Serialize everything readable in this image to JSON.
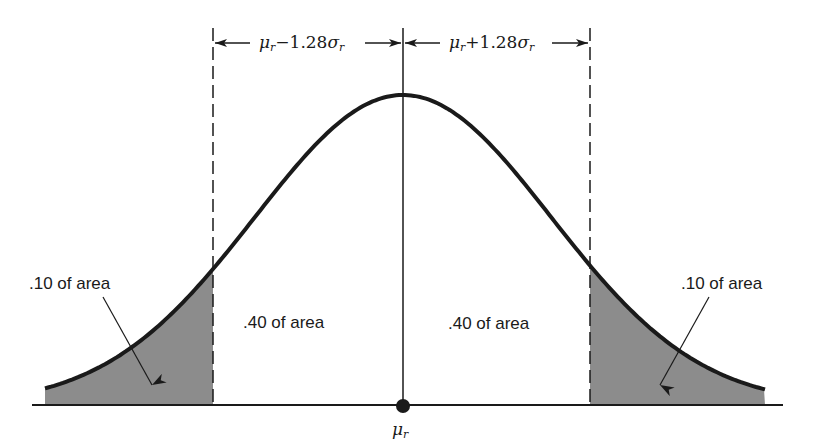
{
  "diagram": {
    "type": "normal-distribution",
    "mean_label": {
      "symbol": "μ",
      "subscript": "r"
    },
    "left_interval": {
      "prefix": "μ",
      "subscript": "r",
      "op": "−",
      "coef": "1.28",
      "sigma": "σ",
      "sigma_sub": "r"
    },
    "right_interval": {
      "prefix": "μ",
      "subscript": "r",
      "op": "+",
      "coef": "1.28",
      "sigma": "σ",
      "sigma_sub": "r"
    },
    "regions": [
      {
        "label": ".10 of area",
        "position": "left-tail",
        "shaded": true
      },
      {
        "label": ".40 of area",
        "position": "left-center",
        "shaded": false
      },
      {
        "label": ".40 of area",
        "position": "right-center",
        "shaded": false
      },
      {
        "label": ".10 of area",
        "position": "right-tail",
        "shaded": true
      }
    ],
    "colors": {
      "curve": "#1a1a1a",
      "shade": "#8c8c8c",
      "axis": "#1a1a1a"
    },
    "geometry": {
      "center_x": 403,
      "sigma_px": 148,
      "axis_y": 405,
      "peak_y": 95,
      "x_start": 45,
      "x_end": 765,
      "cut_left": 213,
      "cut_right": 590
    }
  }
}
